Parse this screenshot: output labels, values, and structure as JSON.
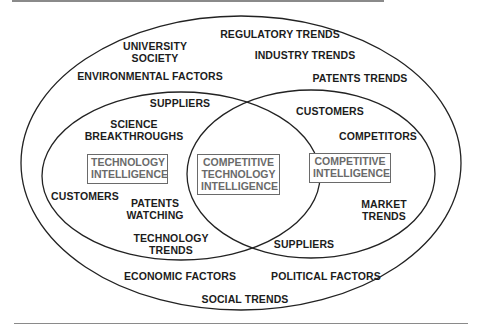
{
  "diagram": {
    "type": "venn",
    "outer_labels": {
      "regulatory_trends": "REGULATORY TRENDS",
      "university_society": "UNIVERSITY\nSOCIETY",
      "industry_trends": "INDUSTRY TRENDS",
      "environmental_factors": "ENVIRONMENTAL FACTORS",
      "patents_trends": "PATENTS TRENDS",
      "economic_factors": "ECONOMIC  FACTORS",
      "political_factors": "POLITICAL FACTORS",
      "social_trends": "SOCIAL TRENDS"
    },
    "left_circle": {
      "title": "TECHNOLOGY\nINTELLIGENCE",
      "items": {
        "suppliers": "SUPPLIERS",
        "science_breakthroughs": "SCIENCE\nBREAKTHROUGHS",
        "customers": "CUSTOMERS",
        "patents_watching": "PATENTS\nWATCHING",
        "technology_trends": "TECHNOLOGY\nTRENDS"
      }
    },
    "right_circle": {
      "title": "COMPETITIVE\nINTELLIGENCE",
      "items": {
        "customers": "CUSTOMERS",
        "competitors": "COMPETITORS",
        "market_trends": "MARKET\nTRENDS",
        "suppliers": "SUPPLIERS"
      }
    },
    "intersection": {
      "title": "COMPETITIVE\nTECHNOLOGY\nINTELLIGENCE"
    },
    "colors": {
      "line": "#222222",
      "text": "#1c1c1c",
      "box": "#6a6a6a"
    }
  }
}
